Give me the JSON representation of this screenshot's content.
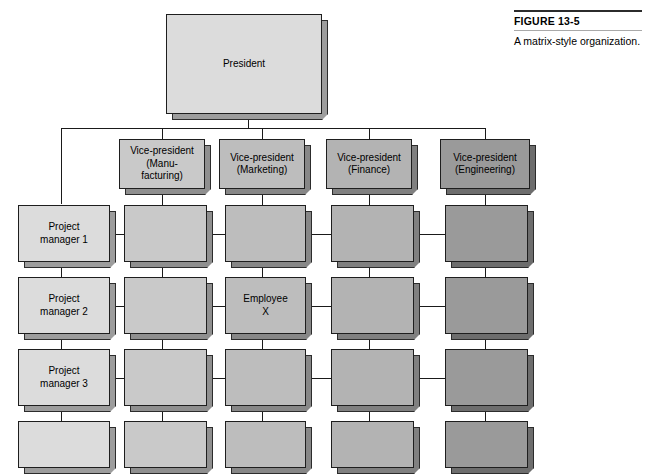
{
  "figure": {
    "number": "FIGURE 13-5",
    "caption": "A matrix-style organization."
  },
  "diagram": {
    "type": "matrix-organization-chart",
    "root": {
      "label": "President",
      "tone": "t0"
    },
    "functional_heads": [
      {
        "label": "Vice-president\n(Manu-\nfacturing)",
        "line1": "Vice-president",
        "line2": "(Manu-",
        "line3": "facturing)",
        "tone": "t1"
      },
      {
        "label": "Vice-president\n(Marketing)",
        "line1": "Vice-president",
        "line2": "(Marketing)",
        "line3": "",
        "tone": "t2"
      },
      {
        "label": "Vice-president\n(Finance)",
        "line1": "Vice-president",
        "line2": "(Finance)",
        "line3": "",
        "tone": "t3"
      },
      {
        "label": "Vice-president\n(Engineering)",
        "line1": "Vice-president",
        "line2": "(Engineering)",
        "line3": "",
        "tone": "t5"
      }
    ],
    "project_managers": [
      {
        "line1": "Project",
        "line2": "manager 1",
        "tone": "t0"
      },
      {
        "line1": "Project",
        "line2": "manager 2",
        "tone": "t0"
      },
      {
        "line1": "Project",
        "line2": "manager 3",
        "tone": "t0"
      },
      {
        "line1": "",
        "line2": "",
        "tone": "t0"
      }
    ],
    "grid": {
      "rows": 4,
      "columns": 4,
      "column_tones": [
        "t1",
        "t2",
        "t3",
        "t5"
      ],
      "cells": [
        [
          {
            "label": ""
          },
          {
            "label": ""
          },
          {
            "label": ""
          },
          {
            "label": ""
          }
        ],
        [
          {
            "label": ""
          },
          {
            "line1": "Employee",
            "line2": "X"
          },
          {
            "label": ""
          },
          {
            "label": ""
          }
        ],
        [
          {
            "label": ""
          },
          {
            "label": ""
          },
          {
            "label": ""
          },
          {
            "label": ""
          }
        ],
        [
          {
            "label": ""
          },
          {
            "label": ""
          },
          {
            "label": ""
          },
          {
            "label": ""
          }
        ]
      ]
    },
    "highlighted_employee": {
      "line1": "Employee",
      "line2": "X",
      "row": 2,
      "column": "Marketing"
    }
  },
  "colors": {
    "page_background": "#ffffff",
    "outline": "#1e1e1e",
    "connector": "#1a1a1a",
    "tone_lightest": "#dcdcdc",
    "tone_darkest": "#9a9a9a",
    "rule": "#2b2b2b"
  }
}
